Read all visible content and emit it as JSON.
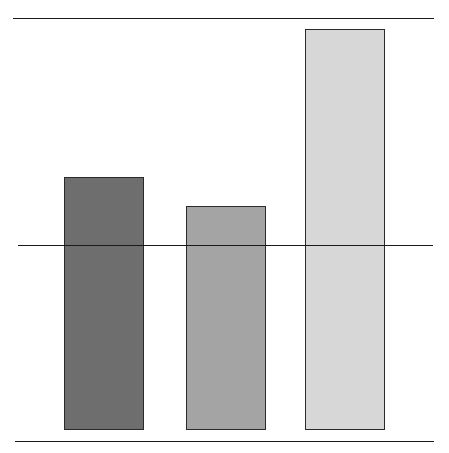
{
  "chart_data": {
    "type": "bar",
    "title": "",
    "xlabel": "",
    "ylabel": "",
    "categories": [
      "",
      "",
      ""
    ],
    "values": [
      1.37,
      1.21,
      2.17
    ],
    "colors": [
      "#6e6e6e",
      "#a4a4a4",
      "#d7d7d7"
    ],
    "reference_lines": [
      {
        "role": "top-rule",
        "y_value": 2.22
      },
      {
        "role": "reference-line",
        "y_value": 1.0
      },
      {
        "role": "bottom-rule",
        "y_value": -0.06
      }
    ],
    "ylim": [
      0,
      2.25
    ],
    "grid": false,
    "legend": null,
    "tick_labels": "none visible"
  }
}
